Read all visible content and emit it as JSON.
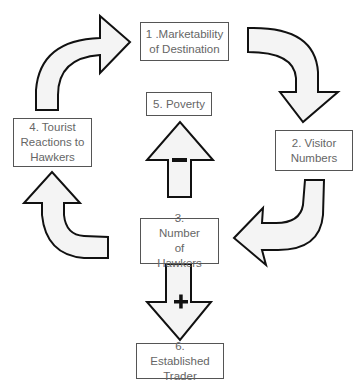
{
  "diagram": {
    "type": "causal-loop",
    "nodes": [
      {
        "id": 1,
        "label": "1 .Marketability of Destination"
      },
      {
        "id": 2,
        "label": "2. Visitor Numbers"
      },
      {
        "id": 3,
        "label": "3. Number of Hawkers"
      },
      {
        "id": 4,
        "label": "4. Tourist Reactions to Hawkers"
      },
      {
        "id": 5,
        "label": "5. Poverty"
      },
      {
        "id": 6,
        "label": "6. Established Trader"
      }
    ],
    "edges": [
      {
        "from": 1,
        "to": 2,
        "sign": ""
      },
      {
        "from": 2,
        "to": 3,
        "sign": ""
      },
      {
        "from": 3,
        "to": 4,
        "sign": ""
      },
      {
        "from": 4,
        "to": 1,
        "sign": ""
      },
      {
        "from": 3,
        "to": 5,
        "sign": "−"
      },
      {
        "from": 3,
        "to": 6,
        "sign": "+"
      }
    ],
    "signs": {
      "poverty_arrow": "−",
      "trader_arrow": "+"
    }
  }
}
